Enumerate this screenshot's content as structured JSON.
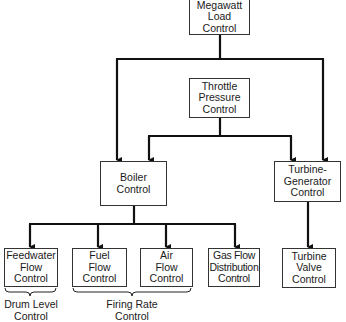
{
  "diagram": {
    "nodes": {
      "megawatt": {
        "label": "Megawatt\nLoad\nControl"
      },
      "throttle": {
        "label": "Throttle\nPressure\nControl"
      },
      "boiler": {
        "label": "Boiler\nControl"
      },
      "turbine_generator": {
        "label": "Turbine-\nGenerator\nControl"
      },
      "feedwater": {
        "label": "Feedwater\nFlow\nControl"
      },
      "fuel": {
        "label": "Fuel\nFlow\nControl"
      },
      "air": {
        "label": "Air\nFlow\nControl"
      },
      "gas_flow": {
        "label": "Gas Flow\nDistribution\nControl"
      },
      "turbine_valve": {
        "label": "Turbine\nValve\nControl"
      }
    },
    "groups": {
      "drum_level": {
        "label": "Drum Level\nControl",
        "members": [
          "feedwater"
        ]
      },
      "firing_rate": {
        "label": "Firing Rate\nControl",
        "members": [
          "fuel",
          "air"
        ]
      }
    },
    "edges": [
      {
        "from": "megawatt",
        "to": "boiler"
      },
      {
        "from": "megawatt",
        "to": "turbine_generator"
      },
      {
        "from": "throttle",
        "to": "boiler"
      },
      {
        "from": "throttle",
        "to": "turbine_generator"
      },
      {
        "from": "boiler",
        "to": "feedwater"
      },
      {
        "from": "boiler",
        "to": "fuel"
      },
      {
        "from": "boiler",
        "to": "air"
      },
      {
        "from": "boiler",
        "to": "gas_flow"
      },
      {
        "from": "turbine_generator",
        "to": "turbine_valve"
      }
    ]
  }
}
